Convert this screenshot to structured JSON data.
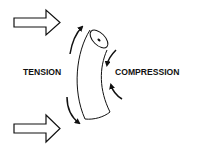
{
  "diagram": {
    "type": "bending-stress-illustration",
    "labels": {
      "tension": "TENSION",
      "compression": "COMPRESSION"
    },
    "elements": [
      {
        "name": "applied-force-arrow-top",
        "direction": "right"
      },
      {
        "name": "applied-force-arrow-bottom",
        "direction": "right"
      },
      {
        "name": "bent-cylinder",
        "description": "curved tubular beam bending, convex side left"
      },
      {
        "name": "tension-arrows",
        "side": "left",
        "count": 2,
        "direction": "outward along convex surface"
      },
      {
        "name": "compression-arrows",
        "side": "right",
        "count": 2,
        "direction": "inward along concave surface"
      }
    ],
    "colors": {
      "stroke": "#111111",
      "background": "#ffffff"
    }
  }
}
